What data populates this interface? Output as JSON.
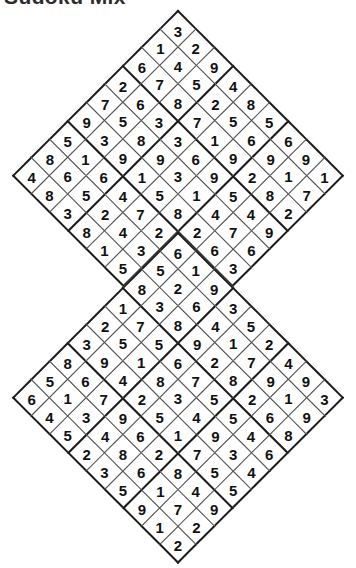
{
  "page": {
    "title": "Sudoku Mix",
    "background_color": "#ffffff",
    "grid_line_color": "#4a4a4a",
    "block_line_color": "#1b1b1b",
    "digit_color": "#111111",
    "puzzle_type": "twin-diamond-sudoku",
    "grid_count": 2,
    "grid_size": 9,
    "rotation_degrees": 45
  },
  "puzzle": {
    "top_grid": {
      "name": "top-diamond-grid",
      "apex_digit": "3",
      "left_tip_digit": "4",
      "right_tip_digit": "7",
      "rows": [
        [
          "3",
          "2",
          "9",
          "4",
          "8",
          "5",
          "6",
          "9",
          "1"
        ],
        [
          "1",
          "4",
          "5",
          "2",
          "5",
          "6",
          "9",
          "1",
          "7"
        ],
        [
          "6",
          "7",
          "8",
          "7",
          "1",
          "9",
          "2",
          "8",
          "2"
        ],
        [
          "2",
          "6",
          "3",
          "3",
          "6",
          "9",
          "5",
          "4",
          "9"
        ],
        [
          "7",
          "5",
          "8",
          "9",
          "3",
          "1",
          "4",
          "7",
          "6"
        ],
        [
          "9",
          "3",
          "9",
          "1",
          "5",
          "8",
          "2",
          "6",
          "3"
        ],
        [
          "5",
          "1",
          "6",
          "4",
          "7",
          "2",
          "9",
          "5",
          "8"
        ],
        [
          "8",
          "6",
          "5",
          "2",
          "4",
          "3",
          "7",
          "1",
          "2"
        ],
        [
          "4",
          "8",
          "3",
          "8",
          "1",
          "5",
          "6",
          "4",
          "7"
        ]
      ],
      "diagonal_rows_top_to_bottom": [
        [
          "3"
        ],
        [
          "1",
          "2"
        ],
        [
          "6",
          "4",
          "9"
        ],
        [
          "2",
          "7",
          "5",
          "4"
        ],
        [
          "7",
          "6",
          "8",
          "2",
          "8"
        ],
        [
          "9",
          "5",
          "4",
          "3",
          "7",
          "5"
        ],
        [
          "5",
          "8",
          "3",
          "8",
          "1",
          "6",
          "6"
        ],
        [
          "8",
          "9",
          "1",
          "6",
          "3",
          "9",
          "9",
          "1"
        ],
        [
          "4",
          "1",
          "6",
          "5",
          "9",
          "7",
          "5",
          "3",
          "7"
        ],
        [
          "3",
          "2",
          "7",
          "4",
          "1",
          "1",
          "2",
          "8"
        ],
        [
          "7",
          "9",
          "2",
          "2",
          "8",
          "5",
          "4"
        ],
        [
          "1",
          "6",
          "3",
          "7",
          "4",
          "9"
        ],
        [
          "5",
          "4",
          "4",
          "6",
          "2"
        ],
        [
          "8",
          "3",
          "8",
          "3"
        ],
        [
          "2",
          "7",
          "1"
        ],
        [
          "5",
          "9"
        ],
        [
          "6"
        ]
      ]
    },
    "bottom_grid": {
      "name": "bottom-diamond-grid",
      "apex_digit": "6",
      "left_tip_digit": "6",
      "right_tip_digit": "3",
      "bottom_tip_digit": "2",
      "rows": [
        [
          "6",
          "1",
          "9",
          "3",
          "5",
          "2",
          "4",
          "9",
          "3"
        ],
        [
          "5",
          "2",
          "6",
          "4",
          "1",
          "7",
          "9",
          "1",
          "9"
        ],
        [
          "8",
          "3",
          "8",
          "9",
          "2",
          "8",
          "2",
          "6",
          "8"
        ],
        [
          "1",
          "7",
          "5",
          "6",
          "7",
          "5",
          "5",
          "4",
          "6"
        ],
        [
          "2",
          "5",
          "1",
          "8",
          "3",
          "4",
          "9",
          "3",
          "4"
        ],
        [
          "3",
          "9",
          "4",
          "2",
          "5",
          "1",
          "7",
          "5",
          "5"
        ],
        [
          "8",
          "6",
          "7",
          "9",
          "6",
          "2",
          "8",
          "4",
          "9"
        ],
        [
          "5",
          "1",
          "3",
          "4",
          "8",
          "6",
          "1",
          "7",
          "2"
        ],
        [
          "6",
          "4",
          "5",
          "2",
          "3",
          "5",
          "9",
          "1",
          "2"
        ]
      ],
      "diagonal_rows_top_to_bottom": [
        [
          "6"
        ],
        [
          "5",
          "1"
        ],
        [
          "1",
          "4",
          "2"
        ],
        [
          "7",
          "3",
          "6",
          "9"
        ],
        [
          "9",
          "6",
          "9",
          "3",
          "2"
        ],
        [
          "8",
          "1",
          "8",
          "2",
          "4",
          "7"
        ],
        [
          "6",
          "2",
          "2",
          "7",
          "7",
          "8",
          "5"
        ],
        [
          "5",
          "8",
          "3",
          "8",
          "3",
          "8",
          "2",
          "5"
        ],
        [
          "6",
          "2",
          "3",
          "8",
          "5",
          "1",
          "4",
          "6",
          "3"
        ],
        [
          "5",
          "7",
          "5",
          "9",
          "6",
          "8",
          "1",
          "9"
        ],
        [
          "4",
          "4",
          "8",
          "4",
          "9",
          "7",
          "8"
        ],
        [
          "9",
          "6",
          "2",
          "1",
          "2",
          "6"
        ],
        [
          "1",
          "3",
          "6",
          "3",
          "4"
        ],
        [
          "7",
          "5",
          "4",
          "5"
        ],
        [
          "3",
          "9",
          "7"
        ],
        [
          "5",
          "4"
        ],
        [
          "2"
        ]
      ]
    }
  }
}
